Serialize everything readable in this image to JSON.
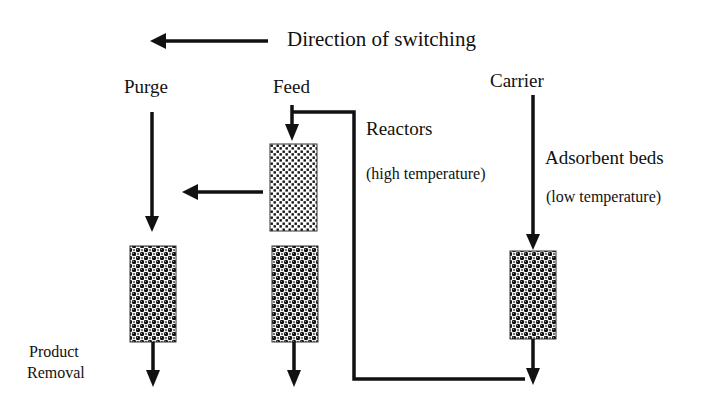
{
  "diagram": {
    "direction_label": "Direction of switching",
    "streams": {
      "purge": "Purge",
      "feed": "Feed",
      "carrier": "Carrier",
      "product_removal_line1": "Product",
      "product_removal_line2": "Removal"
    },
    "annotations": {
      "reactors_title": "Reactors",
      "reactors_note": "(high temperature)",
      "adsorbent_title": "Adsorbent beds",
      "adsorbent_note": "(low temperature)"
    },
    "units": [
      {
        "type": "reactor",
        "column": "middle",
        "pattern": "fine-dots"
      },
      {
        "type": "adsorbent-bed",
        "column": "left",
        "pattern": "packed-spheres"
      },
      {
        "type": "adsorbent-bed",
        "column": "middle",
        "pattern": "packed-spheres"
      },
      {
        "type": "adsorbent-bed",
        "column": "right",
        "pattern": "packed-spheres"
      }
    ],
    "colors": {
      "line": "#111111",
      "background": "#ffffff"
    }
  }
}
